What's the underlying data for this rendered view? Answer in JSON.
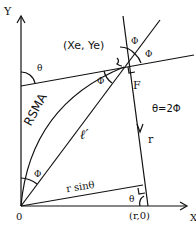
{
  "axes": {
    "y_label": "Y",
    "x_label": "X",
    "origin_label": "0"
  },
  "labels": {
    "point": "(Xe, Ye)",
    "theta_top": "θ",
    "phi_top1": "Φ",
    "phi_top2": "Φ",
    "phi_mid": "Φ",
    "phi_bottom": "Φ",
    "force": "F",
    "relation": "θ=2Φ",
    "rsma": "RSMA",
    "ell": "ℓ′",
    "r": "r",
    "r_sin": "r sinθ",
    "theta_bottom": "θ",
    "r_point": "(r,0)"
  }
}
